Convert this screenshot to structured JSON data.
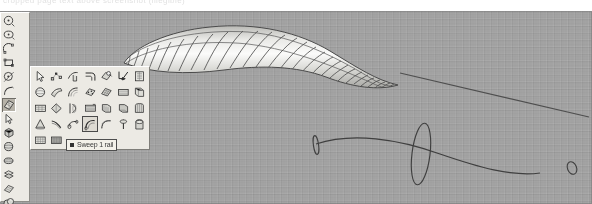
{
  "application": {
    "name": "Rhinoceros 3D modeling viewport",
    "window_kind": "cad-3d-viewport"
  },
  "caption": {
    "text": "cropped page text above screenshot (illegible)"
  },
  "viewport": {
    "name": "Perspective",
    "background_color": "#a2a2a2",
    "grid_visible": true,
    "display_mode": "Shaded"
  },
  "sidebar": {
    "name": "main-toolbar",
    "columns": 2,
    "items": [
      {
        "icon": "circle-center-radius-icon",
        "label": "Circle: center, radius",
        "selected": false
      },
      {
        "icon": "ellipse-icon",
        "label": "Ellipse: from center",
        "selected": false
      },
      {
        "icon": "arc-center-icon",
        "label": "Arc: center, start, angle",
        "selected": false
      },
      {
        "icon": "rectangle-corner-icon",
        "label": "Rectangle: corner to corner",
        "selected": false
      },
      {
        "icon": "circle-tangent-icon",
        "label": "Circle: tangent to curves",
        "selected": false
      },
      {
        "icon": "curve-interpolate-icon",
        "label": "Curve: interpolate points",
        "selected": false
      },
      {
        "icon": "surface-tools-icon",
        "label": "Surface tools",
        "selected": true
      },
      {
        "icon": "pointer-select-icon",
        "label": "Select objects",
        "selected": false
      },
      {
        "icon": "box-solid-icon",
        "label": "Box: corner to corner",
        "selected": false
      },
      {
        "icon": "sphere-solid-icon",
        "label": "Sphere: center, radius",
        "selected": false
      },
      {
        "icon": "ellipsoid-icon",
        "label": "Ellipsoid: from center",
        "selected": false
      },
      {
        "icon": "surface-from-curves-icon",
        "label": "Surface from planar curves",
        "selected": false
      },
      {
        "icon": "mesh-plane-icon",
        "label": "Mesh plane",
        "selected": false
      },
      {
        "icon": "boolean-union-icon",
        "label": "Boolean union",
        "selected": false
      },
      {
        "icon": "cone-icon",
        "label": "Cone",
        "selected": false
      },
      {
        "icon": "extrude-straight-icon",
        "label": "Extrude straight",
        "selected": false
      },
      {
        "icon": "render-color-icon",
        "label": "Render color",
        "selected": false
      },
      {
        "icon": "point-object-icon",
        "label": "Point object",
        "selected": false
      },
      {
        "icon": "arc-tangent-icon",
        "label": "Arc: tangent",
        "selected": false
      },
      {
        "icon": "curve-blend-icon",
        "label": "Curve blend",
        "selected": false
      },
      {
        "icon": "text-object-icon",
        "label": "Text object",
        "selected": false
      },
      {
        "icon": "rectangle-3point-icon",
        "label": "Rectangle: 3 points",
        "selected": false
      }
    ]
  },
  "palette": {
    "name": "surface-tools-palette",
    "floating": true,
    "columns": 7,
    "highlighted_index": 24,
    "items": [
      {
        "icon": "pointer-select-icon",
        "label": "Select objects"
      },
      {
        "icon": "control-points-on-icon",
        "label": "Points on"
      },
      {
        "icon": "surface-edit-tool-icon",
        "label": "Surface edit tools"
      },
      {
        "icon": "surface-fillet-icon",
        "label": "Fillet surface"
      },
      {
        "icon": "surface-analysis-icon",
        "label": "Surface analysis"
      },
      {
        "icon": "surface-draft-angle-icon",
        "label": "Draft angle analysis"
      },
      {
        "icon": "surface-page-icon",
        "label": "Surface from points grid"
      },
      {
        "icon": "sphere-surface-icon",
        "label": "Sphere"
      },
      {
        "icon": "surface-corner-points-icon",
        "label": "Surface from corner points"
      },
      {
        "icon": "surface-3-4-edge-icon",
        "label": "Surface from 3 or 4 edge curves"
      },
      {
        "icon": "surface-patch-icon",
        "label": "Patch"
      },
      {
        "icon": "surface-network-icon",
        "label": "Surface from network of curves"
      },
      {
        "icon": "surface-planar-icon",
        "label": "Surface from planar curves"
      },
      {
        "icon": "surface-extrude-icon",
        "label": "Extrude surface"
      },
      {
        "icon": "surface-grid-icon",
        "label": "Surface from points"
      },
      {
        "icon": "surface-drape-icon",
        "label": "Drape surface"
      },
      {
        "icon": "surface-revolve-icon",
        "label": "Revolve"
      },
      {
        "icon": "surface-rail-revolve-icon",
        "label": "Rail revolve"
      },
      {
        "icon": "surface-loft-icon",
        "label": "Loft"
      },
      {
        "icon": "surface-blend-icon",
        "label": "Blend surface"
      },
      {
        "icon": "surface-heightfield-icon",
        "label": "Heightfield from image"
      },
      {
        "icon": "cone-surface-icon",
        "label": "Cone"
      },
      {
        "icon": "surface-ribbon-icon",
        "label": "Ribbon"
      },
      {
        "icon": "surface-pipe-icon",
        "label": "Pipe"
      },
      {
        "icon": "sweep-1-rail-icon",
        "label": "Sweep 1 rail"
      },
      {
        "icon": "sweep-2-rail-icon",
        "label": "Sweep 2 rails"
      },
      {
        "icon": "surface-offset-icon",
        "label": "Offset surface"
      },
      {
        "icon": "surface-cap-icon",
        "label": "Cap planar holes"
      },
      {
        "icon": "surface-unroll-icon",
        "label": "Unroll developable surface"
      },
      {
        "icon": "surface-mesh-from-nurbs-icon",
        "label": "Mesh from NURBS object"
      }
    ]
  },
  "tooltip": {
    "name": "palette-tooltip",
    "text": "Sweep 1 rail",
    "visible": true
  },
  "scene": {
    "objects": [
      {
        "name": "swept-surface",
        "type": "nurbs-surface",
        "shading": "shaded",
        "isocurves_visible": true,
        "color": "#d9d9d6"
      },
      {
        "name": "rail-curve",
        "type": "curve",
        "color": "#3c3c3c"
      },
      {
        "name": "cross-section-1",
        "type": "ellipse",
        "color": "#3c3c3c"
      },
      {
        "name": "cross-section-2",
        "type": "ellipse",
        "color": "#3c3c3c"
      },
      {
        "name": "cross-section-3",
        "type": "ellipse",
        "color": "#3c3c3c"
      },
      {
        "name": "straight-line",
        "type": "line",
        "color": "#4a4a4a"
      }
    ]
  }
}
